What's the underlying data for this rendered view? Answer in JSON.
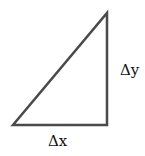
{
  "diagram": {
    "type": "right-triangle",
    "labels": {
      "vertical_side": "Δy",
      "horizontal_side": "Δx"
    },
    "stroke_color": "#4a4a4a",
    "vertices": {
      "bottom_left": [
        13,
        125
      ],
      "bottom_right": [
        107,
        125
      ],
      "top_right": [
        107,
        13
      ]
    }
  }
}
